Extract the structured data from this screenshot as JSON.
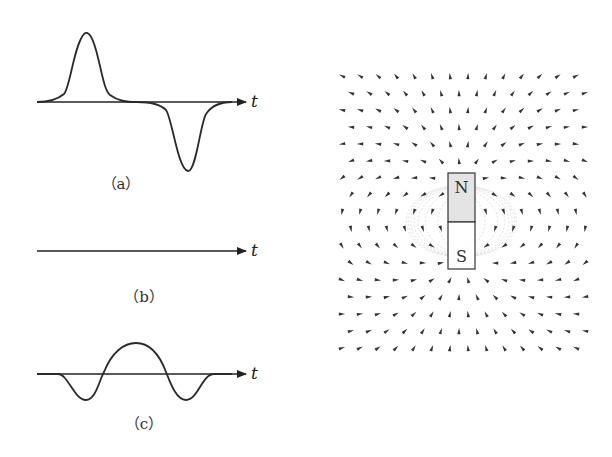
{
  "figure": {
    "panels": [
      {
        "id": "a",
        "caption": "（a）",
        "axis_label": "t",
        "description": "positive pulse followed by negative pulse"
      },
      {
        "id": "b",
        "caption": "（b）",
        "axis_label": "t",
        "description": "zero signal, flat line"
      },
      {
        "id": "c",
        "caption": "（c）",
        "axis_label": "t",
        "description": "negative lobe, positive lobe, negative lobe"
      }
    ],
    "magnet": {
      "north_label": "N",
      "south_label": "S",
      "north_fill": "#e4e4e4",
      "south_fill": "#ffffff"
    }
  },
  "colors": {
    "ink": "#222222",
    "field_line": "#d8d8d8",
    "field_arrow": "#333333"
  }
}
